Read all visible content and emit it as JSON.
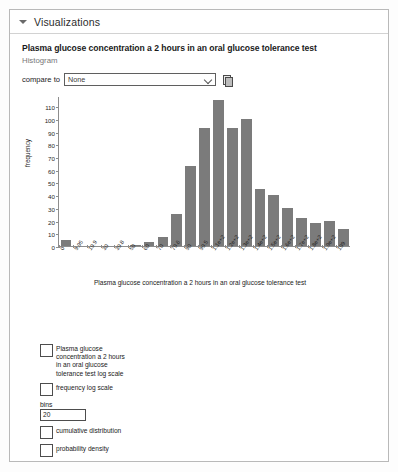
{
  "panel": {
    "header_title": "Visualizations",
    "collapse_icon": "triangle-down-icon"
  },
  "chart_header": {
    "title": "Plasma glucose concentration a 2 hours in an oral glucose tolerance test",
    "subtitle": "Histogram"
  },
  "compare": {
    "label": "compare to",
    "selected": "None",
    "options": [
      "None"
    ],
    "chevron_icon": "chevron-down-icon",
    "copy_icon": "copy-icon"
  },
  "options": {
    "log_scale_label": "Plasma glucose concentration a 2 hours in an oral glucose tolerance test log scale",
    "log_scale_checked": false,
    "frequency_log_scale_label": "frequency log scale",
    "frequency_log_scale_checked": false,
    "bins_label": "bins",
    "bins_value": "20",
    "cumulative_label": "cumulative distribution",
    "cumulative_checked": false,
    "probability_label": "probability density",
    "probability_checked": false
  },
  "colors": {
    "bar": "#7b7b7b",
    "panel_border": "#b9b9b9",
    "axis": "#8d8d8d",
    "subtitle": "#777777"
  },
  "chart_data": {
    "type": "bar",
    "title": "Plasma glucose concentration a 2 hours in an oral glucose tolerance test",
    "subtitle": "Histogram",
    "xlabel": "Plasma glucose concentration a 2 hours in an oral glucose tolerance test",
    "ylabel": "frequency",
    "grid": false,
    "legend": "none",
    "ylim": [
      0,
      118
    ],
    "yticks": [
      0,
      10,
      20,
      30,
      40,
      50,
      60,
      70,
      80,
      90,
      100,
      110
    ],
    "categories": [
      "0",
      "9.95",
      "19.9",
      "30",
      "39.8",
      "50",
      "60",
      "70",
      "79.6",
      "90",
      "99.5",
      "1.1e+2",
      "1.2e+2",
      "1.3e+2",
      "1.4e+2",
      "1.5e+2",
      "1.6e+2",
      "1.7e+2",
      "1.8e+2",
      "1.9e+2",
      "199"
    ],
    "values": [
      5,
      0,
      0,
      0,
      0,
      1,
      3,
      7,
      25,
      63,
      93,
      115,
      93,
      100,
      45,
      40,
      30,
      22,
      18,
      20,
      13
    ]
  }
}
